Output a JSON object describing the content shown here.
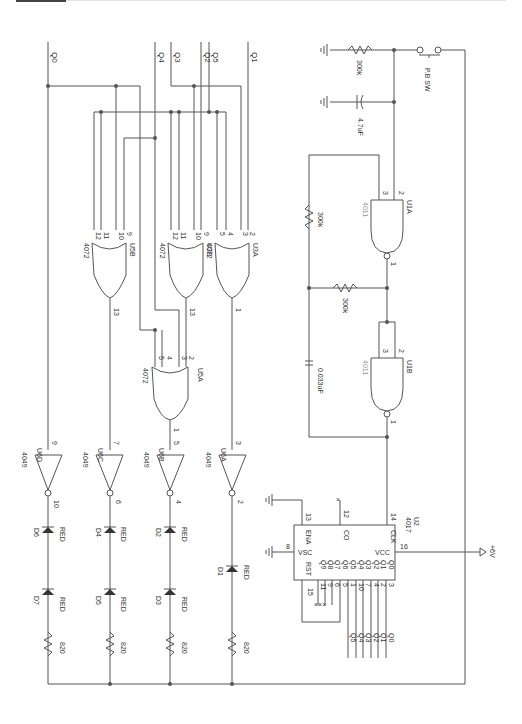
{
  "diagram": {
    "type": "circuit-schematic",
    "orientation": "rotated-90-cw",
    "inputs": {
      "q0": "Q0",
      "q1": "Q1",
      "q2": "Q2",
      "q3": "Q3",
      "q4": "Q4",
      "q5": "Q5"
    },
    "power_on": {
      "resistor": "300k",
      "capacitor": "4.7uF",
      "switch": "P.B SW"
    },
    "oscillator": {
      "u1a": {
        "ref": "U1A",
        "part": "4011",
        "pin_a": "2",
        "pin_b": "3",
        "pin_out": "1"
      },
      "u1b": {
        "ref": "U1B",
        "part": "4011",
        "pin_a": "2",
        "pin_b": "3",
        "pin_out": "1"
      },
      "r1": "300k",
      "r2": "300k",
      "cap": "0.033uF"
    },
    "counter": {
      "ref": "U2",
      "part": "4017",
      "pins": {
        "ena": "ENA",
        "co": "CO",
        "clk": "CLK",
        "vsc": "VSC",
        "vcc": "VCC",
        "rst": "RST"
      },
      "pin_nums": {
        "ena": "13",
        "co": "12",
        "clk": "14",
        "vsc": "8",
        "vcc": "16",
        "rst": "15"
      },
      "outputs": [
        "Q0",
        "Q1",
        "Q2",
        "Q3",
        "Q4",
        "Q5",
        "Q6",
        "Q7",
        "Q8",
        "Q9"
      ],
      "output_pins": [
        "3",
        "2",
        "4",
        "7",
        "10",
        "1",
        "5",
        "6",
        "9",
        "11"
      ],
      "out_labels": [
        "Q0",
        "Q1",
        "Q2",
        "Q3",
        "Q4",
        "Q5"
      ],
      "supply": "+6V"
    },
    "or_gates": {
      "u3a": {
        "ref": "U3A",
        "part": "4072",
        "pins": [
          "2",
          "3",
          "4",
          "5"
        ],
        "out": "1"
      },
      "u3b": {
        "ref": "U3B",
        "part": "4072",
        "pins": [
          "9",
          "10",
          "11",
          "12"
        ],
        "out": "13"
      },
      "u5b": {
        "ref": "U5B",
        "part": "4072",
        "pins": [
          "9",
          "10",
          "11",
          "12"
        ],
        "out": "13"
      },
      "u5a": {
        "ref": "U5A",
        "part": "4072",
        "pins": [
          "2",
          "3",
          "4",
          "5"
        ],
        "out": "1"
      }
    },
    "inverters": [
      {
        "ref": "U6A",
        "part": "4049",
        "in": "3",
        "out": "2"
      },
      {
        "ref": "U6B",
        "part": "4049",
        "in": "5",
        "out": "4"
      },
      {
        "ref": "U6C",
        "part": "4049",
        "in": "7",
        "out": "6"
      },
      {
        "ref": "U6D",
        "part": "4049",
        "in": "9",
        "out": "10"
      }
    ],
    "leds": {
      "d1": {
        "ref": "D1",
        "color": "RED"
      },
      "d2": {
        "ref": "D2",
        "color": "RED"
      },
      "d3": {
        "ref": "D3",
        "color": "RED"
      },
      "d4": {
        "ref": "D4",
        "color": "RED"
      },
      "d5": {
        "ref": "D5",
        "color": "RED"
      },
      "d6": {
        "ref": "D6",
        "color": "RED"
      },
      "d7": {
        "ref": "D7",
        "color": "RED"
      }
    },
    "resistors": [
      "820",
      "820",
      "820",
      "820"
    ]
  }
}
